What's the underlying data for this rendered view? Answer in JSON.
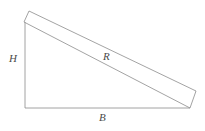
{
  "figure": {
    "type": "geometry-diagram",
    "background_color": "#ffffff",
    "stroke_color": "#8c8c8c",
    "label_color": "#4a4a4a",
    "stroke_width": 0.8
  },
  "labels": {
    "height": "H",
    "ramp": "R",
    "base": "B"
  },
  "geometry": {
    "triangle": {
      "apex_top_left": [
        25,
        22
      ],
      "corner_bottom_left": [
        25,
        108
      ],
      "corner_bottom_right": [
        190,
        108
      ]
    },
    "vertical_leg": {
      "x": 25,
      "y1": 22,
      "y2": 108
    },
    "base_leg": {
      "y": 108,
      "x1": 25,
      "x2": 190
    },
    "ramp_band": {
      "top_left": [
        29,
        11
      ],
      "top_right": [
        196,
        91
      ],
      "bottom_right": [
        190,
        108
      ],
      "bottom_left": [
        24,
        22
      ]
    }
  }
}
